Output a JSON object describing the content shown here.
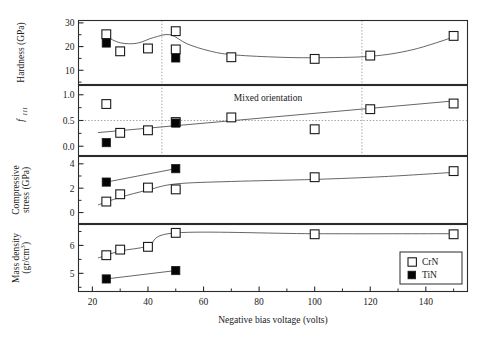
{
  "figure": {
    "xlabel": "Negative bias voltage (volts)",
    "xlim": [
      15,
      155
    ],
    "xticks": [
      20,
      40,
      60,
      80,
      100,
      120,
      140
    ],
    "xticklabels": [
      "20",
      "40",
      "60",
      "80",
      "100",
      "120",
      "140"
    ],
    "guide_lines_x": [
      45,
      117
    ],
    "legend": {
      "items": [
        {
          "label": "CrN",
          "marker": "open-square"
        },
        {
          "label": "TiN",
          "marker": "filled-square"
        }
      ]
    }
  },
  "chart_data": [
    {
      "type": "scatter",
      "panel": 1,
      "title": "",
      "ylabel": "Hardness (GPa)",
      "xlabel": "Negative bias voltage (volts)",
      "ylim": [
        4,
        31
      ],
      "yticks": [
        10,
        20,
        30
      ],
      "yticklabels": [
        "10",
        "20",
        "30"
      ],
      "grid": false,
      "series": [
        {
          "name": "CrN",
          "marker": "open-square",
          "x": [
            25,
            30,
            40,
            50,
            50,
            70,
            100,
            120,
            150
          ],
          "y": [
            25.2,
            18.0,
            19.2,
            26.5,
            18.8,
            15.5,
            14.8,
            16.2,
            24.5
          ]
        },
        {
          "name": "TiN",
          "marker": "filled-square",
          "x": [
            25,
            50
          ],
          "y": [
            21.5,
            15.2
          ]
        }
      ],
      "fit_curve": {
        "name": "CrN trend",
        "x": [
          25,
          30,
          36,
          42,
          48,
          54,
          62,
          70,
          85,
          100,
          120,
          135,
          150
        ],
        "y": [
          24.2,
          21.6,
          21.4,
          23.8,
          25.0,
          21.2,
          18.2,
          16.6,
          15.6,
          15.3,
          15.9,
          18.6,
          24.0
        ]
      }
    },
    {
      "type": "scatter",
      "panel": 2,
      "title": "",
      "ylabel": "f111",
      "ylabel_display": "f",
      "ylabel_sub": "111",
      "ylim": [
        -0.18,
        1.18
      ],
      "yticks": [
        0.0,
        0.5,
        1.0
      ],
      "yticklabels": [
        "0.0",
        "0.5",
        "1.0"
      ],
      "hline": 0.5,
      "annotation": "Mixed orientation",
      "grid": false,
      "series": [
        {
          "name": "CrN",
          "marker": "open-square",
          "x": [
            25,
            30,
            40,
            50,
            70,
            100,
            120,
            150
          ],
          "y": [
            0.82,
            0.26,
            0.31,
            0.47,
            0.56,
            0.33,
            0.72,
            0.83
          ]
        },
        {
          "name": "TiN",
          "marker": "filled-square",
          "x": [
            25,
            50
          ],
          "y": [
            0.07,
            0.45
          ]
        }
      ],
      "fit_curve": {
        "name": "linear trend",
        "x": [
          22,
          150
        ],
        "y": [
          0.265,
          0.88
        ]
      }
    },
    {
      "type": "scatter",
      "panel": 3,
      "title": "",
      "ylabel": "Compressive stress (GPa)",
      "ylim": [
        -0.9,
        4.6
      ],
      "yticks": [
        0,
        2,
        4
      ],
      "yticklabels": [
        "0",
        "2",
        "4"
      ],
      "grid": false,
      "series": [
        {
          "name": "CrN",
          "marker": "open-square",
          "x": [
            25,
            30,
            40,
            50,
            100,
            150
          ],
          "y": [
            0.9,
            1.5,
            2.05,
            1.9,
            2.9,
            3.4
          ]
        },
        {
          "name": "TiN",
          "marker": "filled-square",
          "x": [
            25,
            50
          ],
          "y": [
            2.5,
            3.6
          ]
        }
      ],
      "fit_curves": [
        {
          "name": "CrN trend",
          "x": [
            22,
            30,
            40,
            50,
            70,
            100,
            125,
            150
          ],
          "y": [
            0.62,
            1.25,
            1.85,
            2.35,
            2.55,
            2.72,
            2.95,
            3.3
          ]
        },
        {
          "name": "TiN trend",
          "x": [
            25,
            50
          ],
          "y": [
            2.5,
            3.6
          ]
        }
      ]
    },
    {
      "type": "scatter",
      "panel": 4,
      "title": "",
      "ylabel": "Mass density (gr/cm3)",
      "ylabel_line1": "Mass density",
      "ylabel_line2": "(gr/cm",
      "ylabel_sup": "3",
      "ylim": [
        4.35,
        6.75
      ],
      "yticks": [
        5,
        6
      ],
      "yticklabels": [
        "5",
        "6"
      ],
      "grid": false,
      "series": [
        {
          "name": "CrN",
          "marker": "open-square",
          "x": [
            25,
            30,
            40,
            50,
            100,
            150
          ],
          "y": [
            5.65,
            5.85,
            5.95,
            6.45,
            6.4,
            6.4
          ]
        },
        {
          "name": "TiN",
          "marker": "filled-square",
          "x": [
            25,
            50
          ],
          "y": [
            4.8,
            5.1
          ]
        }
      ],
      "fit_curves": [
        {
          "name": "CrN trend",
          "x": [
            22,
            30,
            40,
            50,
            100,
            150
          ],
          "y": [
            5.55,
            5.8,
            5.98,
            6.45,
            6.42,
            6.42
          ]
        },
        {
          "name": "TiN trend",
          "x": [
            25,
            50
          ],
          "y": [
            4.8,
            5.1
          ]
        }
      ]
    }
  ]
}
